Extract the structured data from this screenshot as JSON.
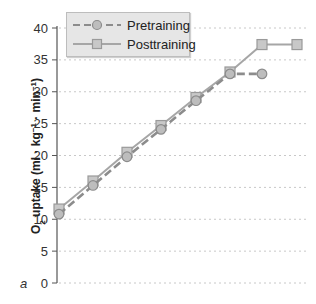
{
  "chart_data": {
    "type": "line",
    "title": "",
    "panel_label": "a",
    "xlabel": "",
    "ylabel": "O2 uptake (ml · kg-1 · min-1)",
    "ylabel_parts": {
      "o": "O",
      "sub": "2",
      "mid": " uptake (ml · kg",
      "sup1": "−1",
      "mid2": " · min",
      "sup2": "−1",
      "end": ")"
    },
    "ylim": [
      0,
      40
    ],
    "yticks": [
      0,
      5,
      10,
      15,
      20,
      25,
      30,
      35,
      40
    ],
    "grid": "horizontal dotted",
    "legend_position": "top-left",
    "x": [
      1,
      2,
      3,
      4,
      5,
      6,
      7,
      8
    ],
    "series": [
      {
        "name": "Pretraining",
        "style": "dashed",
        "marker": "circle",
        "color": "#8c8c8c",
        "values": [
          10.8,
          15.3,
          19.8,
          24.1,
          28.6,
          32.8,
          32.8,
          null
        ]
      },
      {
        "name": "Posttraining",
        "style": "solid",
        "marker": "square",
        "color": "#a6a6a6",
        "values": [
          11.6,
          16.0,
          20.5,
          24.7,
          29.1,
          33.1,
          37.4,
          37.4
        ]
      }
    ]
  },
  "legend": {
    "items": [
      {
        "label": "Pretraining"
      },
      {
        "label": "Posttraining"
      }
    ]
  }
}
